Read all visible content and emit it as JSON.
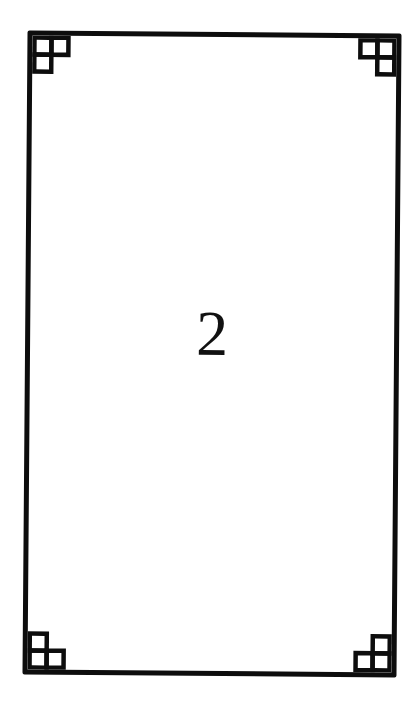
{
  "card": {
    "number": "2",
    "border_color": "#0d0d0d",
    "background": "#ffffff",
    "corner_ornament": "three-square-L-icon"
  }
}
